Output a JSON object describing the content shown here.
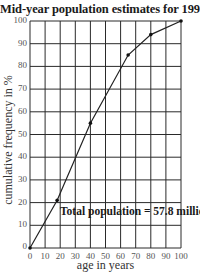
{
  "chart_data": {
    "type": "line",
    "title": "Mid-year population estimates for 1991",
    "xlabel": "age in years",
    "ylabel": "cumulative frequency in %",
    "xlim": [
      0,
      100
    ],
    "ylim": [
      0,
      100
    ],
    "x_ticks": [
      0,
      10,
      20,
      30,
      40,
      50,
      60,
      70,
      80,
      90,
      100
    ],
    "y_ticks": [
      0,
      10,
      20,
      30,
      40,
      50,
      60,
      70,
      80,
      90,
      100
    ],
    "grid": true,
    "legend": null,
    "annotations": [
      "Total population = 57.8 million"
    ],
    "series": [
      {
        "name": "cumulative frequency",
        "x": [
          0,
          18,
          40,
          65,
          80,
          100
        ],
        "y": [
          0,
          21,
          55,
          85,
          94,
          100
        ],
        "markers": true
      }
    ]
  },
  "labels": {
    "title": "Mid-year population estimates for 1991",
    "xlabel": "age in years",
    "ylabel": "cumulative frequency in %",
    "annotation": "Total population = 57.8 million"
  }
}
